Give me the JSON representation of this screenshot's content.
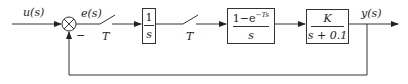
{
  "diagram": {
    "type": "control-system-block-diagram",
    "signals": {
      "input": "u(s)",
      "error": "e(s)",
      "output": "y(s)",
      "feedback_sign": "−"
    },
    "samplers": [
      {
        "label": "T"
      },
      {
        "label": "T"
      }
    ],
    "blocks": [
      {
        "id": "integrator",
        "numerator": "1",
        "denominator": "s"
      },
      {
        "id": "zoh",
        "numerator_base": "1−e",
        "numerator_exp": "−Ts",
        "denominator": "s"
      },
      {
        "id": "plant",
        "numerator": "K",
        "denominator": "s + 0.1"
      }
    ],
    "colors": {
      "line": "#333333",
      "background": "#ffffff"
    }
  }
}
